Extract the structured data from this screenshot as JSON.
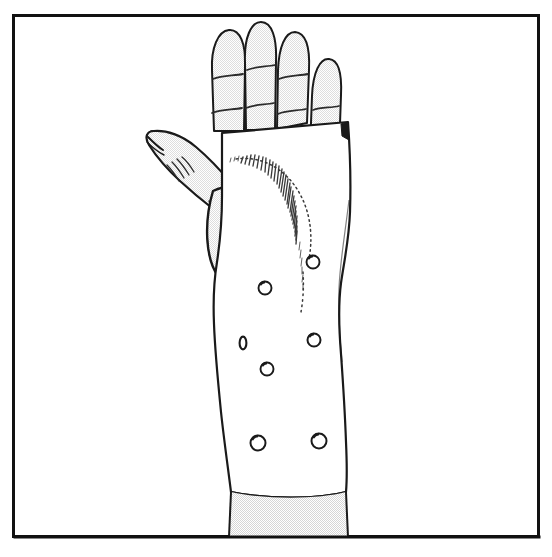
{
  "figure": {
    "title": "Hand wearing a volar wrist splint (orthosis)",
    "style": "black-and-white-line-art-medical-illustration",
    "canvas": {
      "width": 552,
      "height": 557
    },
    "background_color": "#ffffff"
  },
  "frame": {
    "name": "rectangular-border",
    "x": 12,
    "y": 14,
    "width": 528,
    "height": 524,
    "stroke_color": "#111111",
    "stroke_width": 3,
    "fill": "none"
  },
  "palette": {
    "outline": "#1a1a1a",
    "outline_soft": "#333333",
    "skin_fill": "#f1f1f1",
    "splint_fill": "#ffffff",
    "forearm_fill": "#efefef",
    "crease_line": "#2b2b2b",
    "hatch_line": "#3a3a3a",
    "hole_ring": "#1a1a1a",
    "hole_fill": "#ffffff"
  },
  "hand": {
    "name": "hand",
    "orientation": "palm-facing-viewer-fingers-up",
    "fingers": [
      {
        "name": "index-finger",
        "label": "Index",
        "tip_x": 228,
        "tip_y": 30,
        "base_y": 130,
        "width": 27,
        "creases": [
          {
            "x": 222,
            "y": 77,
            "length": 22,
            "tilt": -6
          },
          {
            "x": 220,
            "y": 112,
            "length": 24,
            "tilt": -7
          }
        ]
      },
      {
        "name": "middle-finger",
        "label": "Middle",
        "tip_x": 258,
        "tip_y": 22,
        "base_y": 128,
        "width": 27,
        "creases": [
          {
            "x": 252,
            "y": 68,
            "length": 22,
            "tilt": -4
          },
          {
            "x": 250,
            "y": 107,
            "length": 24,
            "tilt": -5
          }
        ]
      },
      {
        "name": "ring-finger",
        "label": "Ring",
        "tip_x": 290,
        "tip_y": 32,
        "base_y": 126,
        "width": 26,
        "creases": [
          {
            "x": 284,
            "y": 77,
            "length": 21,
            "tilt": -3
          },
          {
            "x": 282,
            "y": 113,
            "length": 23,
            "tilt": -3
          }
        ]
      },
      {
        "name": "little-finger",
        "label": "Little",
        "tip_x": 327,
        "tip_y": 58,
        "base_y": 152,
        "width": 23,
        "creases": [
          {
            "x": 322,
            "y": 110,
            "length": 19,
            "tilt": -2
          },
          {
            "x": 326,
            "y": 143,
            "length": 18,
            "tilt": -2
          }
        ]
      }
    ],
    "thumb": {
      "name": "thumb",
      "label": "Thumb",
      "tip_x": 152,
      "tip_y": 133,
      "nail_fold": true,
      "crease_hatch_count": 4,
      "thenar_eminence": {
        "name": "thenar-eminence",
        "cx": 234,
        "cy": 222,
        "rx": 46,
        "ry": 55
      }
    },
    "palm_visible": false
  },
  "splint": {
    "name": "wrist-splint",
    "label": "Volar wrist splint",
    "fill": "#ffffff",
    "stroke": "#1a1a1a",
    "top_edge_y": 126,
    "bottom_edge_y": 492,
    "left_edge_x": 214,
    "right_edge_x": 348,
    "shading": {
      "name": "thumb-web-hatching",
      "description": "fine curved hatch marks along the thenar cut-out",
      "line_count": 46,
      "arc_cx": 262,
      "arc_cy": 243,
      "arc_r": 92
    },
    "vent_holes": [
      {
        "name": "vent-hole-1",
        "cx": 313,
        "cy": 262,
        "r": 6.5,
        "shape": "round"
      },
      {
        "name": "vent-hole-2",
        "cx": 265,
        "cy": 288,
        "r": 6.5,
        "shape": "round"
      },
      {
        "name": "vent-hole-3",
        "cx": 243,
        "cy": 343,
        "r": 4.0,
        "shape": "slit"
      },
      {
        "name": "vent-hole-4",
        "cx": 314,
        "cy": 340,
        "r": 6.5,
        "shape": "round"
      },
      {
        "name": "vent-hole-5",
        "cx": 267,
        "cy": 369,
        "r": 6.5,
        "shape": "round"
      },
      {
        "name": "vent-hole-6",
        "cx": 258,
        "cy": 443,
        "r": 7.5,
        "shape": "round"
      },
      {
        "name": "vent-hole-7",
        "cx": 319,
        "cy": 441,
        "r": 7.5,
        "shape": "round"
      }
    ],
    "vent_hole_count": 7
  },
  "forearm": {
    "name": "forearm",
    "label": "Forearm",
    "fill": "#efefef",
    "left_x": 231,
    "right_x": 347,
    "top_y": 492,
    "bottom_y": 537
  },
  "annotations": {
    "has_text_labels": false,
    "caption": ""
  }
}
